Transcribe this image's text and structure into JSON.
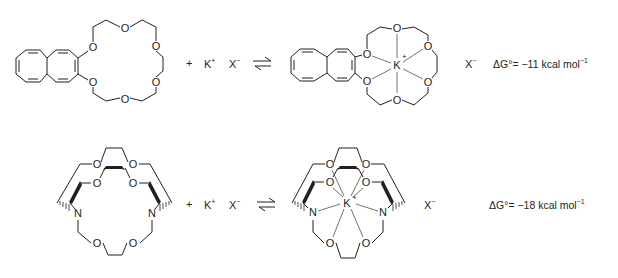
{
  "reactions": [
    {
      "id": "crown-ether",
      "reactant_ligand": "2,3-naphtho-18-crown-6",
      "plus": "+",
      "cation": "K",
      "cation_charge": "+",
      "anion": "X",
      "anion_charge": "−",
      "arrow": "equilibrium",
      "product_cation_label": "K",
      "product_cation_charge": "+",
      "product_anion": "X",
      "product_anion_charge": "−",
      "delta_g_symbol": "ΔG°",
      "delta_g_eq": "= −",
      "delta_g_value": "11",
      "delta_g_units": "kcal mol",
      "delta_g_exp": "−1"
    },
    {
      "id": "cryptand",
      "reactant_ligand": "[2.2.2]cryptand",
      "plus": "+",
      "cation": "K",
      "cation_charge": "+",
      "anion": "X",
      "anion_charge": "−",
      "arrow": "equilibrium",
      "product_cation_label": "K",
      "product_cation_charge": "+",
      "product_anion": "X",
      "product_anion_charge": "−",
      "delta_g_symbol": "ΔG°",
      "delta_g_eq": "= −",
      "delta_g_value": "18",
      "delta_g_units": "kcal mol",
      "delta_g_exp": "−1"
    }
  ],
  "atoms": {
    "oxygen": "O",
    "nitrogen": "N",
    "potassium": "K"
  },
  "colors": {
    "ink": "#231f20",
    "background": "#ffffff"
  }
}
